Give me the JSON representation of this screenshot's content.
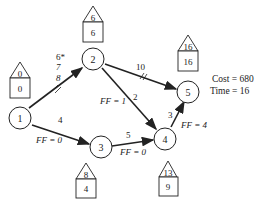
{
  "nodes": [
    {
      "id": "1",
      "label": "1",
      "es_top": "0",
      "ls_bottom": "0"
    },
    {
      "id": "2",
      "label": "2",
      "es_top": "6",
      "ls_bottom": "6"
    },
    {
      "id": "3",
      "label": "3",
      "es_top": "8",
      "ls_bottom": "4"
    },
    {
      "id": "4",
      "label": "4",
      "es_top": "13",
      "ls_bottom": "9"
    },
    {
      "id": "5",
      "label": "5",
      "es_top": "16",
      "ls_bottom": "16"
    }
  ],
  "edges": [
    {
      "from": "1",
      "to": "2",
      "durations": [
        "6*",
        "7",
        "8"
      ],
      "crashed": true
    },
    {
      "from": "1",
      "to": "3",
      "duration": "4",
      "free_float": "FF = 0"
    },
    {
      "from": "2",
      "to": "5",
      "duration": "10",
      "crashed": true
    },
    {
      "from": "2",
      "to": "4",
      "duration": "2",
      "free_float": "FF = 1"
    },
    {
      "from": "3",
      "to": "4",
      "duration": "5",
      "free_float": "FF = 0"
    },
    {
      "from": "4",
      "to": "5",
      "duration": "3",
      "free_float": "FF = 4"
    }
  ],
  "summary": {
    "cost": "Cost = 680",
    "time": "Time = 16"
  }
}
